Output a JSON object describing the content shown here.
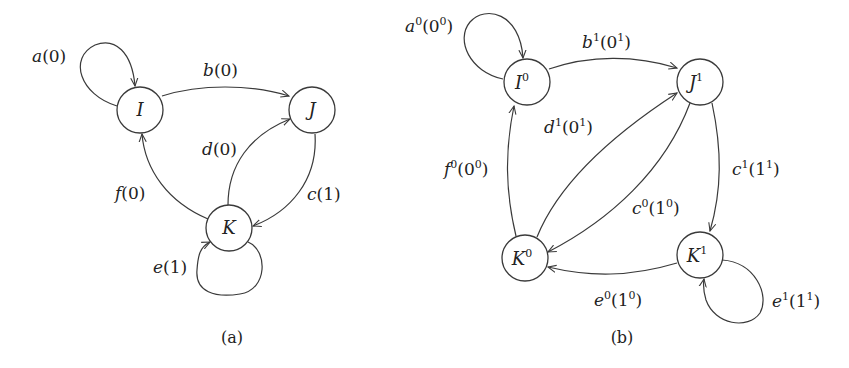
{
  "colors": {
    "stroke": "#3a3a3a",
    "text": "#222222",
    "background": "#ffffff"
  },
  "diagram_a": {
    "caption": "(a)",
    "nodes": [
      {
        "id": "I",
        "label": "I",
        "x": 140,
        "y": 110
      },
      {
        "id": "J",
        "label": "J",
        "x": 312,
        "y": 110
      },
      {
        "id": "K",
        "label": "K",
        "x": 229,
        "y": 228
      }
    ],
    "edges": [
      {
        "from": "I",
        "to": "I",
        "base": "a",
        "arg": "0"
      },
      {
        "from": "I",
        "to": "J",
        "base": "b",
        "arg": "0"
      },
      {
        "from": "J",
        "to": "K",
        "base": "c",
        "arg": "1"
      },
      {
        "from": "K",
        "to": "J",
        "base": "d",
        "arg": "0"
      },
      {
        "from": "K",
        "to": "K",
        "base": "e",
        "arg": "1"
      },
      {
        "from": "K",
        "to": "I",
        "base": "f",
        "arg": "0"
      }
    ]
  },
  "diagram_b": {
    "caption": "(b)",
    "nodes": [
      {
        "id": "I0",
        "label": "I",
        "sup": "0",
        "x": 527,
        "y": 82
      },
      {
        "id": "J1",
        "label": "J",
        "sup": "1",
        "x": 700,
        "y": 82
      },
      {
        "id": "K0",
        "label": "K",
        "sup": "0",
        "x": 525,
        "y": 258
      },
      {
        "id": "K1",
        "label": "K",
        "sup": "1",
        "x": 700,
        "y": 255
      }
    ],
    "edges": [
      {
        "from": "I0",
        "to": "I0",
        "base": "a",
        "base_sup": "0",
        "arg": "0",
        "arg_sup": "0"
      },
      {
        "from": "I0",
        "to": "J1",
        "base": "b",
        "base_sup": "1",
        "arg": "0",
        "arg_sup": "1"
      },
      {
        "from": "J1",
        "to": "K1",
        "base": "c",
        "base_sup": "1",
        "arg": "1",
        "arg_sup": "1"
      },
      {
        "from": "J1",
        "to": "K0",
        "base": "c",
        "base_sup": "0",
        "arg": "1",
        "arg_sup": "0"
      },
      {
        "from": "K0",
        "to": "J1",
        "base": "d",
        "base_sup": "1",
        "arg": "0",
        "arg_sup": "1"
      },
      {
        "from": "K1",
        "to": "K0",
        "base": "e",
        "base_sup": "0",
        "arg": "1",
        "arg_sup": "0"
      },
      {
        "from": "K1",
        "to": "K1",
        "base": "e",
        "base_sup": "1",
        "arg": "1",
        "arg_sup": "1"
      },
      {
        "from": "K0",
        "to": "I0",
        "base": "f",
        "base_sup": "0",
        "arg": "0",
        "arg_sup": "0"
      }
    ]
  }
}
